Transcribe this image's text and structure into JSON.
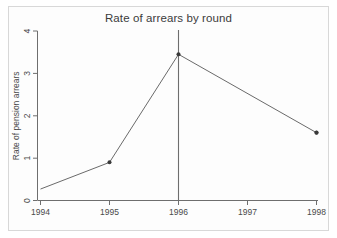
{
  "figure": {
    "background_color": "#ffffff",
    "frame_color": "#d8d8d8",
    "axis_color": "#6e6e6e",
    "line_color": "#6a6a6a",
    "marker_color": "#3a3a3a",
    "text_color": "#3b3b3b"
  },
  "chart_data": {
    "type": "line",
    "title": "Rate of arrears by round",
    "xlabel": "",
    "ylabel": "Rate of pension arrears",
    "x": [
      1994,
      1995,
      1996,
      1998
    ],
    "values": [
      0.27,
      0.9,
      3.45,
      1.6
    ],
    "xticks": [
      1994,
      1995,
      1996,
      1997,
      1998
    ],
    "xtick_labels": [
      "1994",
      "1995",
      "1996",
      "1997",
      "1998"
    ],
    "yticks": [
      0,
      1,
      2,
      3,
      4
    ],
    "ytick_labels": [
      "0",
      "1",
      "2",
      "3",
      "4"
    ],
    "xlim": [
      1994,
      1998
    ],
    "ylim": [
      0,
      4
    ],
    "grid": false,
    "legend": null,
    "markers": "filled-circle",
    "annotations": [
      {
        "type": "vertical-reference-line",
        "x": 1996,
        "label": ""
      }
    ]
  }
}
